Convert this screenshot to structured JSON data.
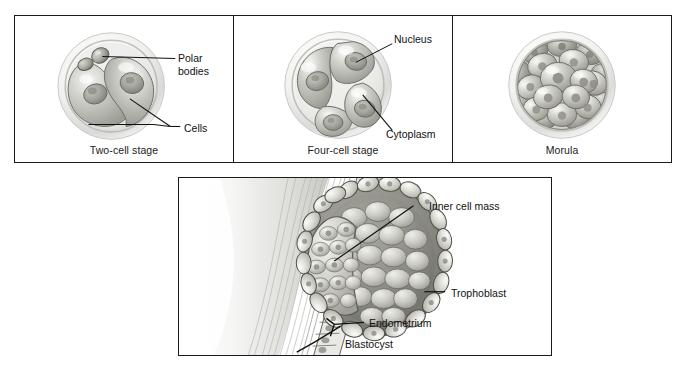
{
  "figure": {
    "background_color": "#ffffff",
    "line_color": "#1a1a1a"
  },
  "panels": [
    {
      "id": "two-cell",
      "caption": "Two-cell stage",
      "annotations": [
        {
          "name": "polar-bodies",
          "text": "Polar bodies"
        },
        {
          "name": "cells",
          "text": "Cells"
        }
      ]
    },
    {
      "id": "four-cell",
      "caption": "Four-cell stage",
      "annotations": [
        {
          "name": "nucleus",
          "text": "Nucleus"
        },
        {
          "name": "cytoplasm",
          "text": "Cytoplasm"
        }
      ]
    },
    {
      "id": "morula",
      "caption": "Morula",
      "annotations": []
    },
    {
      "id": "blastocyst",
      "caption": "",
      "annotations": [
        {
          "name": "inner-cell-mass",
          "text": "Inner cell mass"
        },
        {
          "name": "trophoblast",
          "text": "Trophoblast"
        },
        {
          "name": "endometrium",
          "text": "Endometrium"
        },
        {
          "name": "blastocyst",
          "text": "Blastocyst"
        }
      ]
    }
  ],
  "labels": {
    "polar_bodies_line1": "Polar",
    "polar_bodies_line2": "bodies",
    "cells": "Cells",
    "nucleus": "Nucleus",
    "cytoplasm": "Cytoplasm",
    "inner_cell_mass": "Inner cell mass",
    "trophoblast": "Trophoblast",
    "endometrium": "Endometrium",
    "blastocyst": "Blastocyst",
    "caption_two_cell": "Two-cell stage",
    "caption_four_cell": "Four-cell stage",
    "caption_morula": "Morula"
  }
}
